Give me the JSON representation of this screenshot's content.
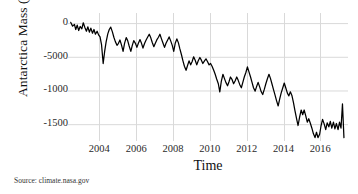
{
  "chart_data": {
    "type": "line",
    "title": "",
    "xlabel": "Time",
    "ylabel": "Antarctica Mass (Gt)",
    "source_note": "Source: climate.nasa.gov",
    "grid": true,
    "legend": "none",
    "line_color": "#000000",
    "grid_color": "#d9d9d9",
    "xlim": [
      2002.3,
      2017.5
    ],
    "ylim": [
      -1750,
      150
    ],
    "y_tick_labels": [
      "0",
      "-5000",
      "-1000",
      "-1500"
    ],
    "y_tick_values": [
      0,
      -500,
      -1000,
      -1500
    ],
    "x_tick_labels": [
      "2004",
      "2006",
      "2008",
      "2010",
      "2012",
      "2014",
      "2016"
    ],
    "x_tick_values": [
      2004,
      2006,
      2008,
      2010,
      2012,
      2014,
      2016
    ],
    "series": [
      {
        "name": "Antarctica ice mass anomaly",
        "x": [
          2002.45,
          2002.55,
          2002.65,
          2002.72,
          2002.8,
          2002.88,
          2002.96,
          2003.05,
          2003.13,
          2003.21,
          2003.3,
          2003.38,
          2003.46,
          2003.54,
          2003.63,
          2003.71,
          2003.79,
          2003.88,
          2003.96,
          2004.04,
          2004.12,
          2004.21,
          2004.29,
          2004.37,
          2004.46,
          2004.54,
          2004.62,
          2004.71,
          2004.79,
          2004.87,
          2004.96,
          2005.04,
          2005.12,
          2005.21,
          2005.29,
          2005.37,
          2005.46,
          2005.54,
          2005.62,
          2005.71,
          2005.79,
          2005.87,
          2005.96,
          2006.04,
          2006.12,
          2006.21,
          2006.29,
          2006.37,
          2006.46,
          2006.54,
          2006.62,
          2006.71,
          2006.79,
          2006.87,
          2006.96,
          2007.04,
          2007.12,
          2007.21,
          2007.29,
          2007.37,
          2007.46,
          2007.54,
          2007.62,
          2007.71,
          2007.79,
          2007.87,
          2007.96,
          2008.04,
          2008.12,
          2008.21,
          2008.29,
          2008.37,
          2008.46,
          2008.54,
          2008.62,
          2008.71,
          2008.79,
          2008.87,
          2008.96,
          2009.04,
          2009.12,
          2009.21,
          2009.29,
          2009.37,
          2009.46,
          2009.54,
          2009.62,
          2009.71,
          2009.79,
          2009.87,
          2009.96,
          2010.04,
          2010.12,
          2010.21,
          2010.29,
          2010.37,
          2010.46,
          2010.54,
          2010.62,
          2010.71,
          2010.79,
          2010.87,
          2010.96,
          2011.04,
          2011.12,
          2011.21,
          2011.29,
          2011.37,
          2011.46,
          2011.54,
          2011.62,
          2011.71,
          2011.79,
          2011.87,
          2011.96,
          2012.04,
          2012.12,
          2012.21,
          2012.29,
          2012.37,
          2012.46,
          2012.54,
          2012.62,
          2012.71,
          2012.79,
          2012.87,
          2012.96,
          2013.04,
          2013.12,
          2013.21,
          2013.29,
          2013.37,
          2013.46,
          2013.54,
          2013.62,
          2013.71,
          2013.79,
          2013.87,
          2013.96,
          2014.04,
          2014.12,
          2014.21,
          2014.29,
          2014.37,
          2014.46,
          2014.54,
          2014.62,
          2014.71,
          2014.79,
          2014.87,
          2014.96,
          2015.04,
          2015.12,
          2015.21,
          2015.29,
          2015.37,
          2015.46,
          2015.54,
          2015.62,
          2015.71,
          2015.79,
          2015.87,
          2015.96,
          2016.04,
          2016.12,
          2016.21,
          2016.29,
          2016.37,
          2016.46,
          2016.54,
          2016.62,
          2016.71,
          2016.79,
          2016.87,
          2016.96,
          2017.04,
          2017.12,
          2017.2,
          2017.28
        ],
        "y": [
          10,
          -45,
          -20,
          -95,
          -30,
          -110,
          -50,
          -85,
          5,
          -60,
          -120,
          -55,
          -135,
          -75,
          -150,
          -95,
          -165,
          -120,
          -175,
          -205,
          -320,
          -600,
          -420,
          -280,
          -160,
          -95,
          -60,
          -130,
          -210,
          -275,
          -330,
          -300,
          -250,
          -330,
          -420,
          -300,
          -215,
          -260,
          -340,
          -420,
          -330,
          -260,
          -300,
          -360,
          -300,
          -245,
          -300,
          -370,
          -300,
          -250,
          -210,
          -165,
          -215,
          -285,
          -350,
          -300,
          -250,
          -210,
          -165,
          -230,
          -300,
          -360,
          -300,
          -250,
          -205,
          -260,
          -330,
          -420,
          -300,
          -235,
          -290,
          -380,
          -470,
          -560,
          -640,
          -700,
          -630,
          -560,
          -620,
          -570,
          -500,
          -555,
          -620,
          -560,
          -510,
          -550,
          -600,
          -560,
          -530,
          -570,
          -620,
          -600,
          -640,
          -700,
          -760,
          -830,
          -900,
          -1020,
          -870,
          -760,
          -820,
          -880,
          -930,
          -870,
          -800,
          -840,
          -900,
          -860,
          -800,
          -850,
          -910,
          -960,
          -880,
          -800,
          -730,
          -650,
          -720,
          -800,
          -880,
          -960,
          -1010,
          -940,
          -880,
          -950,
          -1020,
          -1060,
          -980,
          -900,
          -830,
          -760,
          -820,
          -900,
          -990,
          -1070,
          -1150,
          -1230,
          -1130,
          -1040,
          -960,
          -890,
          -960,
          -1040,
          -1080,
          -1020,
          -1080,
          -1180,
          -1300,
          -1420,
          -1520,
          -1400,
          -1290,
          -1360,
          -1290,
          -1380,
          -1470,
          -1420,
          -1490,
          -1560,
          -1640,
          -1700,
          -1620,
          -1700,
          -1650,
          -1520,
          -1430,
          -1500,
          -1580,
          -1480,
          -1540,
          -1460,
          -1560,
          -1470,
          -1570,
          -1490,
          -1580,
          -1470,
          -1560,
          -1200,
          -1700
        ]
      }
    ]
  }
}
